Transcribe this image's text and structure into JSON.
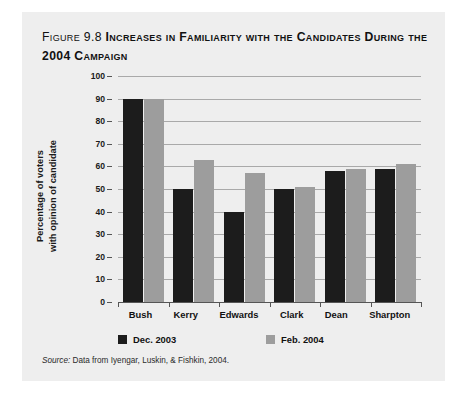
{
  "figure": {
    "number_label": "Figure 9.8",
    "title": "Increases in Familiarity with the Candidates During the 2004 Campaign",
    "source_prefix": "Source:",
    "source_text": "Data from Iyengar, Luskin, & Fishkin, 2004."
  },
  "colors": {
    "card_background": "#eeeeee",
    "series_dec_2003": "#1c1c1c",
    "series_feb_2004": "#9d9d9d",
    "gridline": "#a9a9a9",
    "axis": "#555555",
    "text": "#111111"
  },
  "chart_data": {
    "type": "bar",
    "title": "Increases in Familiarity with the Candidates During the 2004 Campaign",
    "xlabel": "",
    "ylabel": "Percentage of voters with opinion of candidate",
    "ylabel_line1": "Percentage of voters",
    "ylabel_line2": "with opinion of candidate",
    "ylim": [
      0,
      100
    ],
    "ytick_step": 10,
    "yticks": [
      "0",
      "10",
      "20",
      "30",
      "40",
      "50",
      "60",
      "70",
      "80",
      "90",
      "100"
    ],
    "ytick_values": [
      0,
      10,
      20,
      30,
      40,
      50,
      60,
      70,
      80,
      90,
      100
    ],
    "grid": true,
    "grid_axis": "y",
    "legend_position": "bottom",
    "categories": [
      "Bush",
      "Kerry",
      "Edwards",
      "Clark",
      "Dean",
      "Sharpton"
    ],
    "series": [
      {
        "name": "Dec. 2003",
        "color": "#1c1c1c",
        "values": [
          90,
          50,
          40,
          50,
          58,
          59
        ]
      },
      {
        "name": "Feb. 2004",
        "color": "#9d9d9d",
        "values": [
          90,
          63,
          57,
          51,
          59,
          61
        ]
      }
    ]
  }
}
